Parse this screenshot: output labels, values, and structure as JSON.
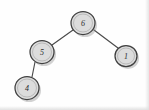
{
  "figure": {
    "type": "binary-tree-diagram",
    "style": "hand-drawn scanned sketch",
    "background_color": "#fefefe",
    "node_fill_color": "#dcdcdc",
    "node_stroke_color": "#3f3f3f",
    "edge_stroke_color": "#4a4a4a",
    "label_color": "#2b2b2b"
  },
  "tree": {
    "nodes": [
      {
        "id": "root",
        "label": "6",
        "cx": 83,
        "cy": 23,
        "r": 12
      },
      {
        "id": "left",
        "label": "5",
        "cx": 42,
        "cy": 52,
        "r": 12
      },
      {
        "id": "right",
        "label": "1",
        "cx": 126,
        "cy": 56,
        "r": 11
      },
      {
        "id": "left-left",
        "label": "4",
        "cx": 27,
        "cy": 88,
        "r": 12
      }
    ],
    "edges": [
      {
        "id": "edge-root-left",
        "from": "root",
        "to": "left",
        "x1": 73,
        "y1": 30,
        "x2": 52,
        "y2": 45
      },
      {
        "id": "edge-root-right",
        "from": "root",
        "to": "right",
        "x1": 94,
        "y1": 30,
        "x2": 118,
        "y2": 48
      },
      {
        "id": "edge-left-leftleft",
        "from": "left",
        "to": "left-left",
        "x1": 35,
        "y1": 62,
        "x2": 32,
        "y2": 77
      }
    ]
  }
}
